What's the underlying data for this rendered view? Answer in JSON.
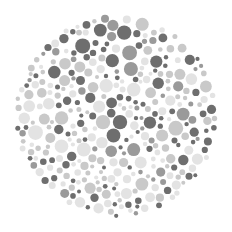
{
  "image": {
    "subject": "dot-pattern color vision test plate",
    "background": "#ffffff",
    "plate": {
      "cx": 116,
      "cy": 116,
      "r": 102
    },
    "palette": {
      "dark": "#6e6e6e",
      "medium": "#9a9a9a",
      "light": "#c9c9c9",
      "pale": "#e3e3e3"
    }
  }
}
